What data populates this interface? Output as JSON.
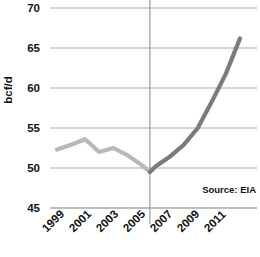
{
  "chart_data": {
    "type": "line",
    "title": "",
    "subtitle": "",
    "xlabel": "",
    "ylabel": "bcf/d",
    "xlim": [
      1999,
      2012
    ],
    "ylim": [
      45,
      70
    ],
    "ytick_labels": [
      "70",
      "65",
      "60",
      "55",
      "50",
      "45"
    ],
    "ytick_values": [
      70,
      65,
      60,
      55,
      50,
      45
    ],
    "xtick_labels": [
      "1999",
      "2001",
      "2003",
      "2005",
      "2007",
      "2009",
      "2011"
    ],
    "xtick_values": [
      1999,
      2001,
      2003,
      2005,
      2007,
      2009,
      2011
    ],
    "grid": "horizontal",
    "legend": "none",
    "annotations": [
      {
        "name": "source-note",
        "text": "Source: EIA"
      }
    ],
    "divider_line": {
      "x": 2005.6,
      "orientation": "vertical",
      "color": "#9a9a9a"
    },
    "series": [
      {
        "name": "history",
        "color": "#b9b9b9",
        "x": [
          1999,
          2000,
          2001,
          2002,
          2003,
          2004,
          2005,
          2005.6
        ],
        "values": [
          52.3,
          52.9,
          53.6,
          52.0,
          52.5,
          51.6,
          50.4,
          49.5
        ]
      },
      {
        "name": "projection",
        "color": "#7b7b7b",
        "x": [
          2005.6,
          2006,
          2007,
          2008,
          2009,
          2010,
          2011,
          2012
        ],
        "values": [
          49.5,
          50.2,
          51.4,
          52.9,
          55.0,
          58.3,
          61.8,
          66.2
        ]
      }
    ]
  },
  "colors": {
    "grid": "#a9a9a9",
    "axis": "#a9a9a9",
    "text": "#111111",
    "history_line": "#b9b9b9",
    "projection_line": "#7b7b7b",
    "background": "#ffffff"
  }
}
